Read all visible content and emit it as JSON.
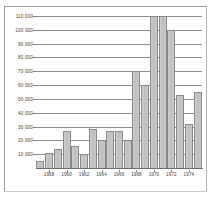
{
  "figure": {
    "title": "",
    "background_color": "#ffffff",
    "frame_color": "#9a9a9a",
    "bar_fill_color": "#c4c4c4",
    "bar_edge_color": "#8a8a8a",
    "gridline_color": "#8d8d8d",
    "text_color": "#3d3d3d"
  },
  "chart_data": {
    "type": "bar",
    "title": "",
    "xlabel": "",
    "ylabel": "",
    "ylim": [
      0,
      110000
    ],
    "xlim": [
      1956.5,
      1975.5
    ],
    "grid": true,
    "legend": null,
    "ytick_labels": [
      "110 000",
      "100 000",
      "90 000",
      "80 000",
      "70 000",
      "60 000",
      "50 000",
      "40 000",
      "30 000",
      "20 000",
      "10 000"
    ],
    "ytick_values": [
      110000,
      100000,
      90000,
      80000,
      70000,
      60000,
      50000,
      40000,
      30000,
      20000,
      10000
    ],
    "xtick_labels": [
      "1958",
      "1960",
      "1962",
      "1964",
      "1966",
      "1968",
      "1970",
      "1972",
      "1974"
    ],
    "xtick_values": [
      1958,
      1960,
      1962,
      1964,
      1966,
      1968,
      1970,
      1972,
      1974
    ],
    "categories": [
      "1957",
      "1958",
      "1959",
      "1960",
      "1961",
      "1962",
      "1963",
      "1964",
      "1965",
      "1966",
      "1967",
      "1968",
      "1969",
      "1970",
      "1971",
      "1972",
      "1973",
      "1974",
      "1975"
    ],
    "values": [
      5000,
      11000,
      14000,
      27000,
      16000,
      10000,
      28000,
      20000,
      27000,
      27000,
      20000,
      70000,
      60000,
      110000,
      110000,
      100000,
      53000,
      32000,
      55000
    ]
  }
}
